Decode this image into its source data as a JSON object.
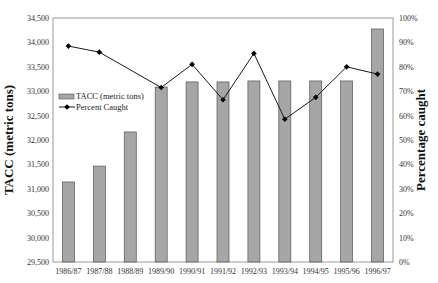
{
  "chart_data": {
    "type": "bar",
    "title": "",
    "categories": [
      "1986/87",
      "1987/88",
      "1988/89",
      "1989/90",
      "1990/91",
      "1991/92",
      "1992/93",
      "1993/94",
      "1994/95",
      "1995/96",
      "1996/97"
    ],
    "series": [
      {
        "name": "TACC (metric tons)",
        "type": "bar",
        "axis": "left",
        "color": "#a6a6a6",
        "values": [
          31140,
          31465,
          32165,
          33085,
          33190,
          33190,
          33210,
          33210,
          33210,
          33210,
          34275
        ]
      },
      {
        "name": "Percent Caught",
        "type": "line",
        "axis": "right",
        "color": "#1a1a1a",
        "values": [
          88.5,
          86,
          null,
          71.5,
          81,
          66.5,
          85.5,
          58.5,
          67.5,
          80,
          77
        ]
      }
    ],
    "ylabel": "TACC (metric tons)",
    "ylabel_right": "Percentage caught",
    "xlabel": "",
    "ylim": [
      29500,
      34500
    ],
    "ylim_right": [
      0,
      100
    ],
    "yticks": [
      "29,500",
      "30,000",
      "30,500",
      "31,000",
      "31,500",
      "32,000",
      "32,500",
      "33,000",
      "33,500",
      "34,000",
      "34,500"
    ],
    "yticks_right": [
      "0%",
      "10%",
      "20%",
      "30%",
      "40%",
      "50%",
      "60%",
      "70%",
      "80%",
      "90%",
      "100%"
    ],
    "grid": false,
    "legend_position": "center-left",
    "legend": [
      "TACC (metric tons)",
      "Percent Caught"
    ]
  }
}
